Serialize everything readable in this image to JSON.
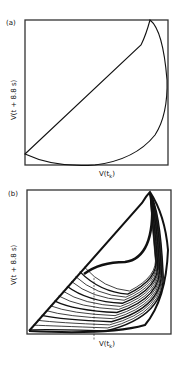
{
  "chart_data": [
    {
      "type": "line",
      "panel_label": "(a)",
      "title": "",
      "xlabel": "V(t_k)",
      "ylabel": "V(t_k + 8.8 s)",
      "grid": false,
      "legend": null,
      "series": [
        {
          "name": "return map (periodic)",
          "description": "Closed loop: straight diagonal from lower-left to upper-right, returning along a curved arc down the right side and across the bottom",
          "points_normalized": [
            [
              0.0,
              0.08
            ],
            [
              0.87,
              0.89
            ],
            [
              0.93,
              1.0
            ],
            [
              0.99,
              0.75
            ],
            [
              0.99,
              0.5
            ],
            [
              0.9,
              0.2
            ],
            [
              0.7,
              0.05
            ],
            [
              0.4,
              0.0
            ],
            [
              0.15,
              0.01
            ],
            [
              0.0,
              0.08
            ]
          ]
        }
      ]
    },
    {
      "type": "line",
      "panel_label": "(b)",
      "title": "",
      "xlabel": "V(t_k)",
      "ylabel": "V(t_k + 8.8 s)",
      "grid": false,
      "legend": null,
      "annotations": [
        "vertical dashed line at x≈0.42"
      ],
      "series": [
        {
          "name": "return map (chaotic)",
          "description": "Dense band of nested folded curves filling region below the diagonal, with a hollow upper lobe",
          "n_curves": 14
        }
      ]
    }
  ],
  "panels": {
    "a": {
      "label": "(a)",
      "xlabel_main": "V(t",
      "xlabel_sub": "k",
      "xlabel_end": ")",
      "ylabel": "V(t  + 8.8 s)"
    },
    "b": {
      "label": "(b)",
      "xlabel_main": "V(t",
      "xlabel_sub": "k",
      "xlabel_end": ")",
      "ylabel": "V(t  + 8.8 s)"
    }
  },
  "colors": {
    "ink": "#111111",
    "background": "#ffffff"
  }
}
